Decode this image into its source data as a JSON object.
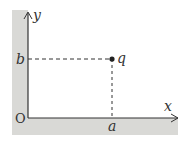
{
  "diagram": {
    "type": "coordinate-point",
    "axes": {
      "x_label": "x",
      "y_label": "y",
      "origin_label": "O"
    },
    "point": {
      "label": "q",
      "x_label": "a",
      "y_label": "b"
    },
    "colors": {
      "wall": "#d9d9d6",
      "line": "#333333"
    }
  }
}
